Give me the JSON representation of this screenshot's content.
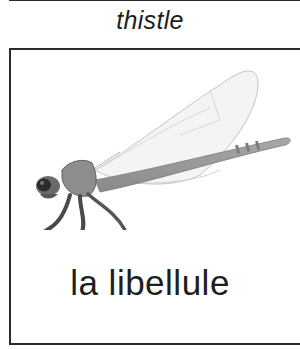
{
  "previous_card": {
    "caption": "thistle"
  },
  "card": {
    "image_subject": "dragonfly-illustration",
    "caption": "la libellule"
  }
}
